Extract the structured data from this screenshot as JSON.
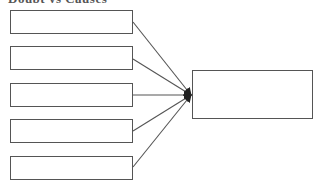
{
  "diagram": {
    "title": "Doubt vs Causes",
    "colors": {
      "stroke": "#555555",
      "arrow": "#222222",
      "background": "#ffffff"
    },
    "left_boxes": [
      {
        "id": "cause-1",
        "label": "",
        "x": 10,
        "y": 10,
        "w": 123,
        "h": 24
      },
      {
        "id": "cause-2",
        "label": "",
        "x": 10,
        "y": 46,
        "w": 123,
        "h": 24
      },
      {
        "id": "cause-3",
        "label": "",
        "x": 10,
        "y": 83,
        "w": 123,
        "h": 24
      },
      {
        "id": "cause-4",
        "label": "",
        "x": 10,
        "y": 119,
        "w": 123,
        "h": 24
      },
      {
        "id": "cause-5",
        "label": "",
        "x": 10,
        "y": 156,
        "w": 123,
        "h": 24
      }
    ],
    "target_box": {
      "id": "effect",
      "label": "",
      "x": 192,
      "y": 70,
      "w": 121,
      "h": 49
    },
    "connectors": [
      {
        "from": "cause-1",
        "x1": 133,
        "y1": 22,
        "x2": 191,
        "y2": 95
      },
      {
        "from": "cause-2",
        "x1": 133,
        "y1": 59,
        "x2": 191,
        "y2": 95
      },
      {
        "from": "cause-3",
        "x1": 133,
        "y1": 95,
        "x2": 191,
        "y2": 95
      },
      {
        "from": "cause-4",
        "x1": 133,
        "y1": 131,
        "x2": 191,
        "y2": 95
      },
      {
        "from": "cause-5",
        "x1": 133,
        "y1": 167,
        "x2": 191,
        "y2": 95
      }
    ]
  }
}
